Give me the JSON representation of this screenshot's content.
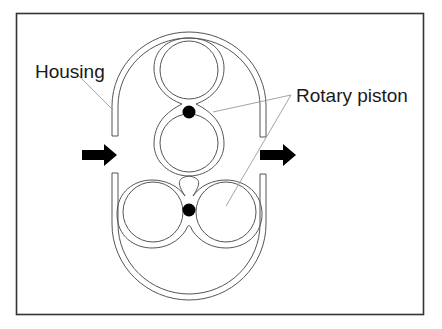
{
  "diagram": {
    "labels": {
      "housing": "Housing",
      "rotary_piston": "Rotary piston"
    },
    "arrows": {
      "inlet": "flow-in-arrow",
      "outlet": "flow-out-arrow"
    },
    "colors": {
      "frame": "#333333",
      "outline": "#555555",
      "leader": "#9a9a9a",
      "fill": "#000000",
      "background": "#ffffff"
    }
  }
}
